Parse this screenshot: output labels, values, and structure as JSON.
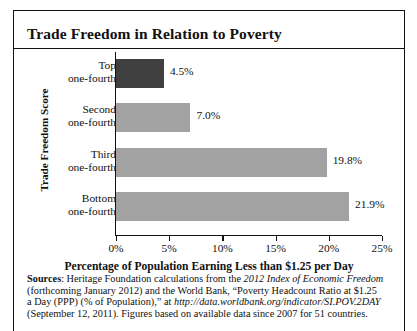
{
  "figure": {
    "title": "Trade Freedom in Relation to Poverty"
  },
  "chart_data": {
    "type": "bar",
    "orientation": "horizontal",
    "title": "Trade Freedom in Relation to Poverty",
    "xlabel": "Percentage of Population Earning Less than $1.25 per Day",
    "ylabel": "Trade Freedom Score",
    "categories": [
      "Top one-fourth",
      "Second one-fourth",
      "Third one-fourth",
      "Bottom one-fourth"
    ],
    "category_lines": [
      [
        "Top",
        "one-fourth"
      ],
      [
        "Second",
        "one-fourth"
      ],
      [
        "Third",
        "one-fourth"
      ],
      [
        "Bottom",
        "one-fourth"
      ]
    ],
    "values": [
      4.5,
      7.0,
      19.8,
      21.9
    ],
    "value_labels": [
      "4.5%",
      "7.0%",
      "19.8%",
      "21.9%"
    ],
    "bar_colors": [
      "#3f3f3f",
      "#a2a2a2",
      "#a2a2a2",
      "#a2a2a2"
    ],
    "xlim": [
      0,
      25
    ],
    "xticks": [
      0,
      5,
      10,
      15,
      20,
      25
    ],
    "xtick_labels": [
      "0%",
      "5%",
      "10%",
      "15%",
      "20%",
      "25%"
    ],
    "grid": false,
    "legend": null
  },
  "source_note": {
    "label": "Sources",
    "line1_pre": ": Heritage Foundation calculations from the ",
    "line1_italic": "2012 Index of Economic Freedom",
    "line2": "(forthcoming January 2012) and the World Bank, “Poverty Headcount Ratio at $1.25",
    "line3_pre": "a Day (PPP) (% of Population),” at ",
    "line3_italic": "http://data.worldbank.org/indicator/SI.POV.2DAY",
    "line4": "(September 12, 2011). Figures based on available data since 2007 for 51 countries."
  }
}
